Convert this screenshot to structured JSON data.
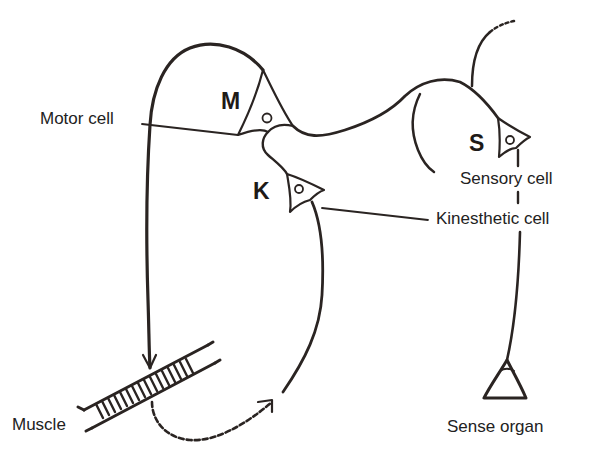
{
  "diagram": {
    "type": "neural reflex circuit",
    "colors": {
      "stroke": "#2a2422",
      "background": "#ffffff",
      "text": "#222222"
    },
    "cells": [
      {
        "id": "motor",
        "letter": "M",
        "label": "Motor cell"
      },
      {
        "id": "kinesthetic",
        "letter": "K",
        "label": "Kinesthetic cell"
      },
      {
        "id": "sensory",
        "letter": "S",
        "label": "Sensory cell"
      }
    ],
    "effector": {
      "label": "Muscle"
    },
    "receptor": {
      "label": "Sense organ"
    },
    "connections": [
      {
        "from": "Motor cell",
        "to": "Muscle",
        "style": "solid",
        "arrow": true
      },
      {
        "from": "Muscle",
        "to": "Kinesthetic cell",
        "style": "dashed",
        "arrow": true
      },
      {
        "from": "Sense organ",
        "to": "Sensory cell",
        "style": "solid",
        "arrow": false
      },
      {
        "from": "Sensory cell",
        "to": "Motor cell",
        "style": "solid",
        "arrow": false
      },
      {
        "from": "Kinesthetic cell",
        "to": "Motor cell",
        "style": "solid",
        "arrow": false
      }
    ]
  }
}
